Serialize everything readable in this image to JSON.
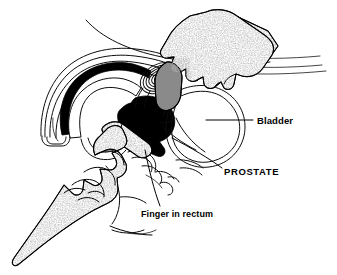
{
  "figure": {
    "background_color": "#ffffff",
    "ink_color": "#000000",
    "glove_texture_color": "#808080",
    "width": 337,
    "height": 275
  },
  "labels": {
    "bladder": {
      "text": "Bladder",
      "style": "mixed-case-bold",
      "x": 257,
      "y": 124
    },
    "prostate": {
      "text": "PROSTATE",
      "style": "uppercase-bold",
      "x": 224,
      "y": 175
    },
    "finger_in_rectum": {
      "text": "Finger in rectum",
      "style": "mixed-case-bold",
      "x": 141,
      "y": 217
    }
  },
  "structures": [
    {
      "name": "examining-hand-upper",
      "description": "Gloved hand pressing on lower abdomen",
      "texture": "stipple"
    },
    {
      "name": "examining-hand-lower",
      "description": "Gloved hand with index finger inserted into rectum",
      "texture": "stipple"
    },
    {
      "name": "bladder-outline",
      "description": "Urinary bladder, double contour"
    },
    {
      "name": "prostate-gland",
      "description": "Prostate shown as concentric oval rings"
    },
    {
      "name": "rectum-cavity",
      "description": "Solid black rectal lumen"
    },
    {
      "name": "abdominal-wall",
      "description": "Concentric arched contour lines of abdominal wall"
    },
    {
      "name": "pelvic-bone",
      "description": "Pubic symphysis and pelvic floor outlines"
    }
  ]
}
